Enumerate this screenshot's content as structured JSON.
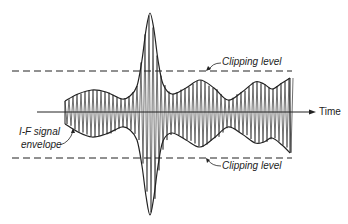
{
  "diagram": {
    "labels": {
      "time": "Time",
      "clipping_top": "Clipping level",
      "clipping_bottom": "Clipping level",
      "envelope_line1": "I-F signal",
      "envelope_line2": "envelope"
    },
    "colors": {
      "ink": "#222222",
      "background": "#ffffff"
    },
    "axis": {
      "y": 112,
      "x_start": 37,
      "x_end": 316
    },
    "clipping_levels": {
      "top_y": 71,
      "bottom_y": 158,
      "x_start": 12,
      "x_end": 292
    },
    "envelope_top": [
      [
        65,
        101
      ],
      [
        78,
        94
      ],
      [
        92,
        90
      ],
      [
        106,
        92
      ],
      [
        122,
        99
      ],
      [
        130,
        96
      ],
      [
        137,
        86
      ],
      [
        142,
        60
      ],
      [
        146,
        30
      ],
      [
        150,
        13
      ],
      [
        154,
        30
      ],
      [
        158,
        60
      ],
      [
        163,
        84
      ],
      [
        172,
        94
      ],
      [
        186,
        88
      ],
      [
        200,
        80
      ],
      [
        214,
        88
      ],
      [
        228,
        100
      ],
      [
        242,
        92
      ],
      [
        255,
        82
      ],
      [
        264,
        84
      ],
      [
        272,
        89
      ],
      [
        282,
        83
      ],
      [
        290,
        78
      ]
    ],
    "envelope_bottom": [
      [
        65,
        124
      ],
      [
        78,
        132
      ],
      [
        92,
        137
      ],
      [
        106,
        134
      ],
      [
        122,
        127
      ],
      [
        130,
        130
      ],
      [
        137,
        140
      ],
      [
        142,
        166
      ],
      [
        146,
        196
      ],
      [
        150,
        215
      ],
      [
        154,
        196
      ],
      [
        158,
        166
      ],
      [
        163,
        141
      ],
      [
        172,
        133
      ],
      [
        186,
        140
      ],
      [
        200,
        147
      ],
      [
        214,
        138
      ],
      [
        228,
        127
      ],
      [
        242,
        134
      ],
      [
        255,
        143
      ],
      [
        264,
        142
      ],
      [
        272,
        138
      ],
      [
        282,
        145
      ],
      [
        290,
        153
      ]
    ],
    "carrier_spacing": 4
  }
}
